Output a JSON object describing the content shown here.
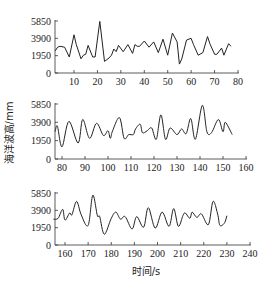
{
  "chart_data": [
    {
      "type": "line",
      "title": "",
      "xlabel": "",
      "ylabel": "海洋波高/mm",
      "xlim": [
        2,
        80
      ],
      "ylim": [
        0,
        5850
      ],
      "xticks": [
        10,
        20,
        30,
        40,
        50,
        60,
        70,
        80
      ],
      "yticks": [
        0,
        1950,
        3900,
        5850
      ],
      "grid": false,
      "series": [
        {
          "name": "wave height",
          "x": [
            2,
            3,
            4,
            6,
            8,
            10,
            11,
            13,
            14,
            15,
            16,
            18,
            19,
            21,
            23,
            25,
            26,
            27,
            28,
            29,
            31,
            33,
            35,
            36,
            37,
            38,
            40,
            42,
            44,
            46,
            48,
            50,
            52,
            54,
            55,
            56,
            58,
            60,
            61,
            63,
            65,
            67,
            68,
            70,
            71,
            73,
            74,
            76,
            77
          ],
          "values": [
            2500,
            2900,
            3000,
            2900,
            1800,
            4300,
            3200,
            1600,
            2000,
            2100,
            3100,
            1800,
            1800,
            5800,
            1300,
            1700,
            2000,
            2700,
            2400,
            3100,
            2400,
            3200,
            2200,
            3200,
            3000,
            3000,
            3600,
            2900,
            3500,
            2300,
            3800,
            2000,
            4500,
            3500,
            1000,
            1600,
            3700,
            3900,
            3200,
            2000,
            2300,
            4100,
            3300,
            2100,
            2100,
            2800,
            2000,
            3300,
            3000
          ]
        }
      ]
    },
    {
      "type": "line",
      "title": "",
      "xlabel": "",
      "ylabel": "海洋波高/mm",
      "xlim": [
        77,
        160
      ],
      "ylim": [
        0,
        5850
      ],
      "xticks": [
        80,
        90,
        100,
        110,
        120,
        130,
        140,
        150,
        160
      ],
      "yticks": [
        0,
        1950,
        3900,
        5850
      ],
      "grid": false,
      "series": [
        {
          "name": "wave height",
          "x": [
            77,
            78,
            80,
            83,
            87,
            89,
            92,
            95,
            98,
            100,
            101,
            102,
            105,
            107,
            109,
            111,
            112,
            114,
            115,
            117,
            119,
            121,
            123,
            125,
            127,
            130,
            132,
            134,
            136,
            138,
            141,
            143,
            145,
            148,
            150,
            151,
            154
          ],
          "values": [
            2900,
            3500,
            1300,
            4000,
            1700,
            4200,
            2200,
            3800,
            2500,
            3000,
            2200,
            3000,
            4400,
            2200,
            2600,
            2600,
            3200,
            3700,
            2800,
            3000,
            3300,
            2100,
            4700,
            2100,
            3300,
            2600,
            3200,
            2700,
            4300,
            2100,
            5700,
            2900,
            2800,
            4200,
            2900,
            3900,
            2600
          ]
        }
      ]
    },
    {
      "type": "line",
      "title": "",
      "xlabel": "时间/s",
      "ylabel": "海洋波高/mm",
      "xlim": [
        155,
        240
      ],
      "ylim": [
        0,
        5850
      ],
      "xticks": [
        160,
        170,
        180,
        190,
        200,
        210,
        220,
        230,
        240
      ],
      "yticks": [
        0,
        1950,
        3900,
        5850
      ],
      "grid": false,
      "series": [
        {
          "name": "wave height",
          "x": [
            155,
            157,
            159,
            160,
            162,
            163,
            165,
            167,
            170,
            172,
            174,
            175,
            177,
            180,
            182,
            184,
            186,
            189,
            191,
            194,
            196,
            199,
            202,
            205,
            207,
            209,
            211,
            212,
            214,
            215,
            217,
            219,
            222,
            224,
            226,
            227,
            229,
            230
          ],
          "values": [
            2900,
            3000,
            4000,
            2800,
            3600,
            3400,
            4900,
            3400,
            2200,
            5600,
            3300,
            3200,
            1200,
            3000,
            3700,
            2900,
            3200,
            1800,
            3200,
            2000,
            4200,
            1900,
            3700,
            2100,
            4100,
            2100,
            3300,
            3600,
            3000,
            3700,
            3100,
            3500,
            2300,
            4900,
            3500,
            2200,
            2500,
            3300
          ]
        }
      ]
    }
  ],
  "panels": [
    {
      "yticks": [
        "5850",
        "3900",
        "1950",
        "0"
      ],
      "xticks": [
        "10",
        "20",
        "30",
        "40",
        "50",
        "60",
        "70",
        "80"
      ]
    },
    {
      "yticks": [
        "5850",
        "3900",
        "1950",
        "0"
      ],
      "xticks": [
        "80",
        "90",
        "100",
        "110",
        "120",
        "130",
        "140",
        "150",
        "160"
      ]
    },
    {
      "yticks": [
        "5850",
        "3900",
        "1950",
        "0"
      ],
      "xticks": [
        "160",
        "170",
        "180",
        "190",
        "200",
        "210",
        "220",
        "230",
        "240"
      ]
    }
  ],
  "labels": {
    "ylabel": "海洋波高/mm",
    "xlabel": "时间/s"
  }
}
